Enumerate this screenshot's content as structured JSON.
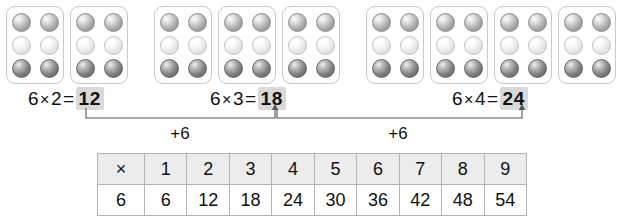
{
  "card_groups": [
    {
      "name": "group-of-2",
      "card_count": 2,
      "left": 6,
      "beads_per_card": 6,
      "bead_rows": [
        "top",
        "middle",
        "bottom"
      ]
    },
    {
      "name": "group-of-3",
      "card_count": 3,
      "left": 154,
      "beads_per_card": 6,
      "bead_rows": [
        "top",
        "middle",
        "bottom"
      ]
    },
    {
      "name": "group-of-4",
      "card_count": 4,
      "left": 366,
      "beads_per_card": 6,
      "bead_rows": [
        "top",
        "middle",
        "bottom"
      ]
    }
  ],
  "equations": [
    {
      "left": 28,
      "factor1": "6",
      "times": "×",
      "factor2": "2",
      "equals": "=",
      "result": "12"
    },
    {
      "left": 210,
      "factor1": "6",
      "times": "×",
      "factor2": "3",
      "equals": "=",
      "result": "18"
    },
    {
      "left": 452,
      "factor1": "6",
      "times": "×",
      "factor2": "4",
      "equals": "=",
      "result": "24"
    }
  ],
  "brackets": [
    {
      "name": "bracket-12-to-18",
      "label": "+6",
      "label_x": 180,
      "start_x": 86,
      "end_x": 275
    },
    {
      "name": "bracket-18-to-24",
      "label": "+6",
      "label_x": 398,
      "start_x": 277,
      "end_x": 522
    }
  ],
  "chart_data": {
    "type": "table",
    "title": "",
    "header_symbol": "×",
    "row_label": "6",
    "categories": [
      "1",
      "2",
      "3",
      "4",
      "5",
      "6",
      "7",
      "8",
      "9"
    ],
    "values": [
      6,
      12,
      18,
      24,
      30,
      36,
      42,
      48,
      54
    ],
    "series": [
      {
        "name": "6",
        "values": [
          6,
          12,
          18,
          24,
          30,
          36,
          42,
          48,
          54
        ]
      }
    ],
    "xlabel": "",
    "ylabel": "",
    "grid": true
  },
  "colors": {
    "highlight": "#d9d9d9",
    "table_header_bg": "#ececec",
    "table_border": "#b4b4b4",
    "card_border": "#c9c9c9",
    "text": "#111111",
    "bracket_line": "#555555"
  }
}
